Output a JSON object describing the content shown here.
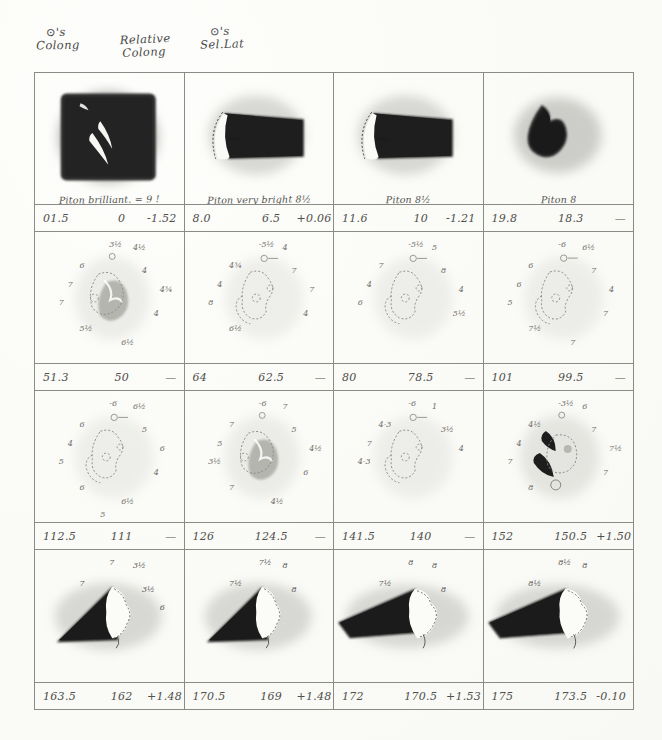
{
  "document": {
    "kind": "handwritten observation plate",
    "subject": "Piton lunar peak drawings"
  },
  "headers": {
    "colong": {
      "line1": "⊙'s",
      "line2": "Colong"
    },
    "relative_colong": {
      "line1": "Relative",
      "line2": "Colong"
    },
    "sel_lat": {
      "line1": "⊙'s",
      "line2": "Sel.Lat"
    }
  },
  "columns": [
    "⊙'s Colong",
    "Relative Colong",
    "⊙'s Sel.Lat"
  ],
  "rows": [
    {
      "cells": [
        {
          "caption": "Piton brilliant. = 9 !",
          "colong": "01.5",
          "rel_colong": "0",
          "sel_lat": "-1.52",
          "sketch": "dark-field-crescents"
        },
        {
          "caption": "Piton very bright 8½",
          "colong": "8.0",
          "rel_colong": "6.5",
          "sel_lat": "+0.06",
          "sketch": "wedge-crescent"
        },
        {
          "caption": "Piton 8½",
          "colong": "11.6",
          "rel_colong": "10",
          "sel_lat": "-1.21",
          "sketch": "wedge-crescent"
        },
        {
          "caption": "Piton 8",
          "colong": "19.8",
          "rel_colong": "18.3",
          "sel_lat": "—",
          "sketch": "dark-blob"
        }
      ]
    },
    {
      "cells": [
        {
          "caption": "",
          "colong": "51.3",
          "rel_colong": "50",
          "sel_lat": "—",
          "sketch": "faint-outline-shaded",
          "annotations": [
            "3½",
            "4½",
            "6",
            "4",
            "4¾",
            "7",
            "7",
            "4",
            "5½",
            "6½"
          ]
        },
        {
          "caption": "",
          "colong": "64",
          "rel_colong": "62.5",
          "sel_lat": "—",
          "sketch": "faint-outline",
          "annotations": [
            "-5½",
            "4",
            "4¾",
            "7",
            "7",
            "4",
            "8",
            "4",
            "6½"
          ]
        },
        {
          "caption": "",
          "colong": "80",
          "rel_colong": "78.5",
          "sel_lat": "—",
          "sketch": "faint-outline",
          "annotations": [
            "-5½",
            "5",
            "7",
            "8",
            "4",
            "4",
            "6",
            "5½"
          ]
        },
        {
          "caption": "",
          "colong": "101",
          "rel_colong": "99.5",
          "sel_lat": "—",
          "sketch": "faint-outline",
          "annotations": [
            "-6",
            "6½",
            "6",
            "7",
            "4",
            "6",
            "5",
            "7",
            "7½",
            "7"
          ]
        }
      ]
    },
    {
      "cells": [
        {
          "caption": "",
          "colong": "112.5",
          "rel_colong": "111",
          "sel_lat": "—",
          "sketch": "faint-outline",
          "annotations": [
            "-6",
            "6½",
            "6",
            "5",
            "6",
            "4",
            "5",
            "4",
            "6",
            "6½",
            "5"
          ]
        },
        {
          "caption": "",
          "colong": "126",
          "rel_colong": "124.5",
          "sel_lat": "—",
          "sketch": "faint-outline-shaded",
          "annotations": [
            "-6",
            "7",
            "7",
            "5",
            "4½",
            "5",
            "3½",
            "6",
            "7",
            "4½"
          ]
        },
        {
          "caption": "",
          "colong": "141.5",
          "rel_colong": "140",
          "sel_lat": "—",
          "sketch": "faint-outline",
          "annotations": [
            "-6",
            "1",
            "4·3",
            "3½",
            "4",
            "7",
            "4·3"
          ]
        },
        {
          "caption": "",
          "colong": "152",
          "rel_colong": "150.5",
          "sel_lat": "+1.50",
          "sketch": "dark-crescents",
          "annotations": [
            "-3½",
            "6",
            "4½",
            "7",
            "7½",
            "4",
            "7",
            "7",
            "8"
          ]
        }
      ]
    },
    {
      "cells": [
        {
          "caption": "",
          "colong": "163.5",
          "rel_colong": "162",
          "sel_lat": "+1.48",
          "sketch": "dark-triangle-peak",
          "annotations": [
            "7",
            "3½",
            "7",
            "3½",
            "6"
          ]
        },
        {
          "caption": "",
          "colong": "170.5",
          "rel_colong": "169",
          "sel_lat": "+1.48",
          "sketch": "dark-triangle-peak",
          "annotations": [
            "7½",
            "8",
            "7½",
            "8"
          ]
        },
        {
          "caption": "",
          "colong": "172",
          "rel_colong": "170.5",
          "sel_lat": "+1.53",
          "sketch": "dark-wedge-peak",
          "annotations": [
            "8",
            "8",
            "7½",
            "8"
          ]
        },
        {
          "caption": "",
          "colong": "175",
          "rel_colong": "173.5",
          "sel_lat": "-0.10",
          "sketch": "dark-wedge-peak",
          "annotations": [
            "8½",
            "8",
            "8½"
          ]
        }
      ]
    }
  ]
}
